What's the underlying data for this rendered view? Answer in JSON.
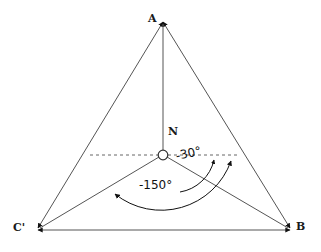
{
  "figure": {
    "kind": "geometric-diagram",
    "background_color": "#ffffff",
    "stroke_color": "#555555",
    "text_color": "#111111",
    "width": 321,
    "height": 252
  },
  "vertices": {
    "apex": {
      "label": "A",
      "x": 163,
      "y": 22
    },
    "right": {
      "label": "B",
      "x": 292,
      "y": 230
    },
    "left": {
      "label": "C'",
      "x": 36,
      "y": 230
    },
    "node": {
      "label": "N",
      "x": 163,
      "y": 155,
      "marker": "open-circle",
      "radius": 5
    }
  },
  "angles": [
    {
      "name": "angle-minus-30",
      "label": "-30°",
      "value": -30,
      "unit": "degrees",
      "from": "N-B ray",
      "to": "horizontal dashed reference"
    },
    {
      "name": "angle-minus-150",
      "label": "-150°",
      "value": -150,
      "unit": "degrees",
      "from": "horizontal dashed reference",
      "to": "N-C' ray"
    }
  ],
  "edges": [
    {
      "name": "edge-a-b",
      "from": "A",
      "to": "B",
      "style": "solid",
      "arrow": "both"
    },
    {
      "name": "edge-a-cprime",
      "from": "A",
      "to": "C'",
      "style": "solid",
      "arrow": "both"
    },
    {
      "name": "edge-cprime-b",
      "from": "C'",
      "to": "B",
      "style": "solid",
      "arrow": "both"
    },
    {
      "name": "edge-n-a",
      "from": "N",
      "to": "A",
      "style": "solid",
      "arrow": "end"
    },
    {
      "name": "edge-n-b",
      "from": "N",
      "to": "B",
      "style": "solid",
      "arrow": "end"
    },
    {
      "name": "edge-n-cprime",
      "from": "N",
      "to": "C'",
      "style": "solid",
      "arrow": "end"
    },
    {
      "name": "reference-dashed-line",
      "from": "A-C' edge",
      "to": "A-B edge",
      "style": "dashed",
      "arrow": "none"
    }
  ]
}
